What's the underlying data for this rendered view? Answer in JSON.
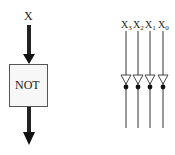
{
  "left_diagram": {
    "input_label": "X",
    "gate_label": "NOT"
  },
  "right_diagram": {
    "inputs": [
      {
        "base": "X",
        "sub": "3"
      },
      {
        "base": "X",
        "sub": "2"
      },
      {
        "base": "X",
        "sub": "1"
      },
      {
        "base": "X",
        "sub": "0"
      }
    ]
  },
  "colors": {
    "line": "#222222",
    "arrow": "#111111",
    "box_border": "#555555",
    "box_fill": "#f7f7f7"
  }
}
